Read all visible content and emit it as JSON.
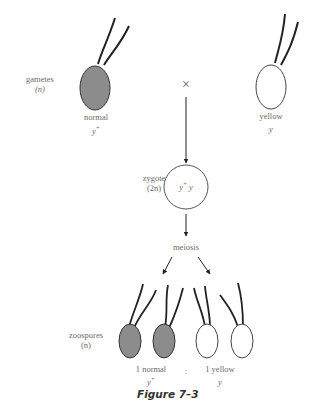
{
  "figure": {
    "caption": "Figure 7–3",
    "cross_symbol": "×",
    "gametes": {
      "label": "gametes",
      "ploidy": "(n)",
      "left": {
        "phenotype": "normal",
        "genotype": "y",
        "genotype_sup": "+",
        "fill": "#8c8c8c"
      },
      "right": {
        "phenotype": "yellow",
        "genotype": "y",
        "fill": "#ffffff"
      }
    },
    "zygote": {
      "label": "zygote",
      "ploidy": "(2n)",
      "genotype_a": "y",
      "genotype_a_sup": "+",
      "genotype_b": "y"
    },
    "process": "meiosis",
    "zoospores": {
      "label": "zoospores",
      "ploidy": "(n)",
      "normal_count": "1 normal",
      "normal_genotype": "y",
      "normal_genotype_sup": "+",
      "ratio_sep": ":",
      "yellow_count": "1 yellow",
      "yellow_genotype": "y"
    }
  }
}
